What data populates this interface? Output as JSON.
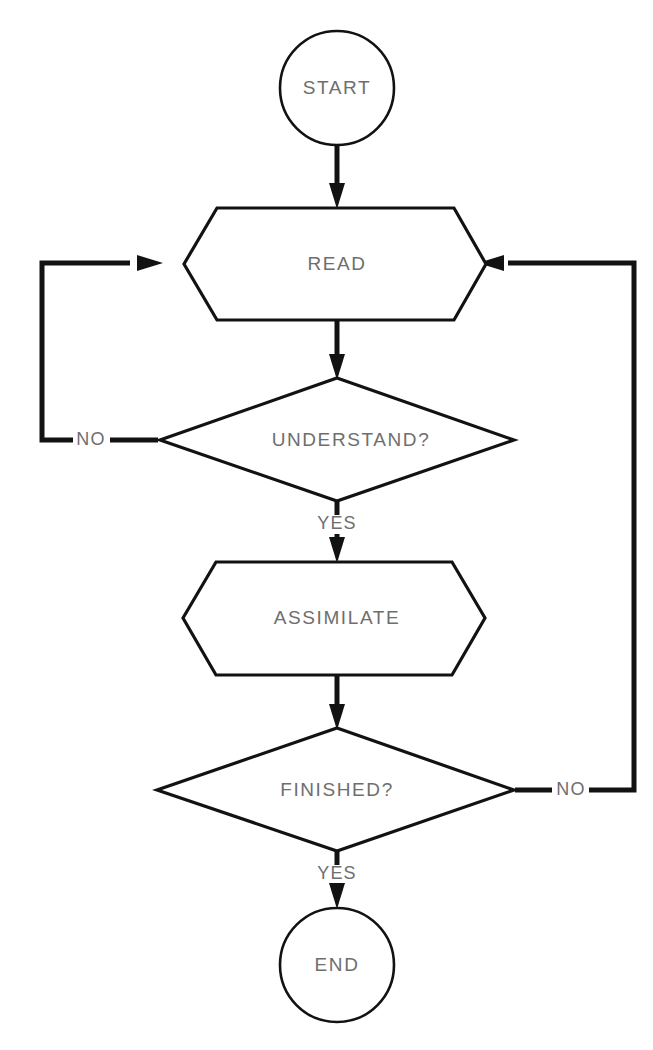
{
  "diagram": {
    "background_color": "#ffffff",
    "line_color": "#121212",
    "text_color": "#6e6e6e",
    "nodes": {
      "start": {
        "label": "START",
        "shape": "circle"
      },
      "read": {
        "label": "READ",
        "shape": "hexagon"
      },
      "understand": {
        "label": "UNDERSTAND?",
        "shape": "diamond"
      },
      "assimilate": {
        "label": "ASSIMILATE",
        "shape": "hexagon"
      },
      "finished": {
        "label": "FINISHED?",
        "shape": "diamond"
      },
      "end": {
        "label": "END",
        "shape": "circle"
      }
    },
    "edge_labels": {
      "understand_no": "NO",
      "understand_yes": "YES",
      "finished_no": "NO",
      "finished_yes": "YES"
    }
  }
}
